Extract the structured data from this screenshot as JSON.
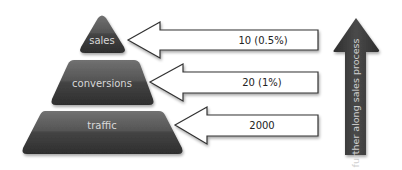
{
  "diagram": {
    "type": "sales-funnel-pyramid",
    "pyramid": [
      {
        "label": "sales",
        "value": "10 (0.5%)"
      },
      {
        "label": "conversions",
        "value": "20 (1%)"
      },
      {
        "label": "traffic",
        "value": "2000"
      }
    ],
    "vertical_arrow_label": "further along sales process"
  },
  "colors": {
    "layer_fill_top": "#6a6a6a",
    "layer_fill_bottom": "#333333",
    "layer_text": "#d8d8d8",
    "arrow_stroke": "#333333",
    "arrow_fill": "#ffffff",
    "value_text": "#222222",
    "vertical_arrow_fill": "#3a3a3a",
    "vertical_arrow_text": "#d0d0d0"
  }
}
